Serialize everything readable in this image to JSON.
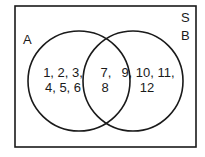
{
  "diagram": {
    "type": "venn",
    "universal_set_label": "S",
    "sets": [
      {
        "name": "A",
        "label": "A"
      },
      {
        "name": "B",
        "label": "B"
      }
    ],
    "regions": {
      "a_only": {
        "line1": "1, 2, 3,",
        "line2": "4, 5, 6"
      },
      "intersection": {
        "line1": "7,",
        "line2": "8"
      },
      "b_only": {
        "line1": "9, 10, 11,",
        "line2": "12"
      }
    },
    "colors": {
      "stroke": "#1a1a1a",
      "background": "#ffffff"
    }
  }
}
